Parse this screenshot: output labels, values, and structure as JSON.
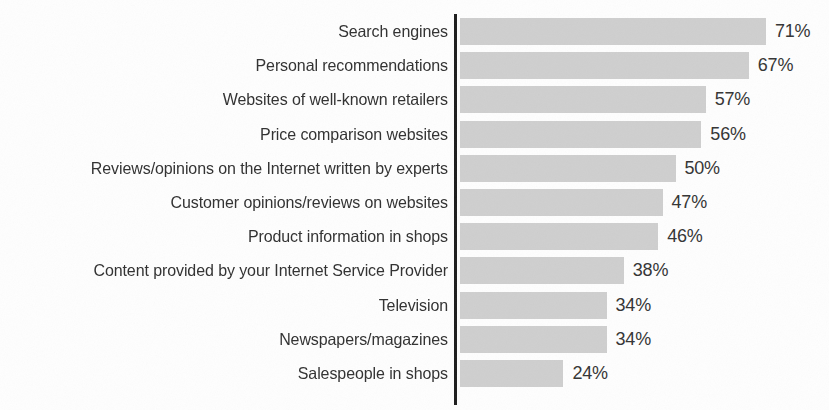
{
  "chart_data": {
    "type": "bar",
    "orientation": "horizontal",
    "title": "",
    "subtitle": "",
    "xlabel": "",
    "ylabel": "",
    "xlim": [
      0,
      71
    ],
    "grid": false,
    "legend": null,
    "value_suffix": "%",
    "categories": [
      "Search engines",
      "Personal recommendations",
      "Websites of well-known retailers",
      "Price comparison websites",
      "Reviews/opinions on the Internet written by experts",
      "Customer opinions/reviews on websites",
      "Product information in shops",
      "Content provided by your Internet Service Provider",
      "Television",
      "Newspapers/magazines",
      "Salespeople in shops"
    ],
    "values": [
      71,
      67,
      57,
      56,
      50,
      47,
      46,
      38,
      34,
      34,
      24
    ],
    "value_labels": [
      "71%",
      "67%",
      "57%",
      "56%",
      "50%",
      "47%",
      "46%",
      "38%",
      "34%",
      "34%",
      "24%"
    ],
    "colors": {
      "bar": "#cfcfcf",
      "axis": "#1d1d1d",
      "label_text": "#313131",
      "value_text": "#343434",
      "background": "#fefefe"
    }
  }
}
